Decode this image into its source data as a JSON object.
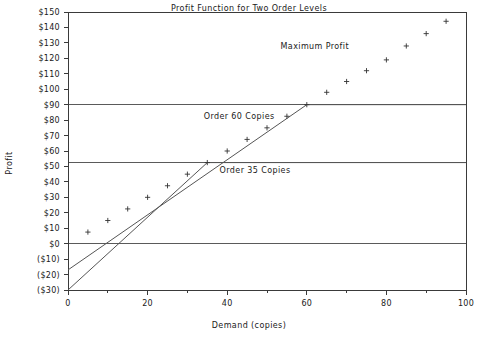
{
  "chart_data": {
    "type": "scatter",
    "title": "Profit Function for Two Order Levels",
    "xlabel": "Demand (copies)",
    "ylabel": "Profit",
    "xlim": [
      0,
      100
    ],
    "ylim": [
      -30,
      150
    ],
    "grid": false,
    "legend": "none",
    "x_ticks": [
      0,
      20,
      40,
      60,
      80,
      100
    ],
    "x_tick_labels": [
      "0",
      "20",
      "40",
      "60",
      "80",
      "100"
    ],
    "x_minor_ticks": [
      10,
      30,
      50,
      70,
      90
    ],
    "y_ticks": [
      -30,
      -20,
      -10,
      0,
      10,
      20,
      30,
      40,
      50,
      60,
      70,
      80,
      90,
      100,
      110,
      120,
      130,
      140,
      150
    ],
    "y_tick_labels": [
      "($30)",
      "($20)",
      "($10)",
      "$0",
      "$10",
      "$20",
      "$30",
      "$40",
      "$50",
      "$60",
      "$70",
      "$80",
      "$90",
      "$100",
      "$110",
      "$120",
      "$130",
      "$140",
      "$150"
    ],
    "reference_lines": [
      {
        "name": "zero-line",
        "y": 0
      },
      {
        "name": "order-35-plateau-level",
        "y": 52.5
      },
      {
        "name": "order-60-plateau-level",
        "y": 90
      }
    ],
    "series": [
      {
        "name": "Order 35 Copies",
        "type": "line",
        "points": [
          [
            0,
            -30
          ],
          [
            35,
            52.5
          ],
          [
            100,
            52.5
          ]
        ],
        "annotation": {
          "label": "Order 35 Copies",
          "x": 47,
          "y": 46
        }
      },
      {
        "name": "Order 60 Copies",
        "type": "line",
        "points": [
          [
            0,
            -17
          ],
          [
            60,
            90
          ],
          [
            100,
            90
          ]
        ],
        "annotation": {
          "label": "Order 60 Copies",
          "x": 43,
          "y": 81
        }
      },
      {
        "name": "Maximum Profit",
        "type": "scatter",
        "marker": "plus",
        "annotation": {
          "label": "Maximum Profit",
          "x": 62,
          "y": 126
        },
        "points": [
          [
            5,
            7.5
          ],
          [
            10,
            15
          ],
          [
            15,
            22.5
          ],
          [
            20,
            30
          ],
          [
            25,
            37.5
          ],
          [
            30,
            45
          ],
          [
            35,
            52.5
          ],
          [
            40,
            60
          ],
          [
            45,
            67.5
          ],
          [
            50,
            75
          ],
          [
            55,
            82.5
          ],
          [
            60,
            90
          ],
          [
            65,
            98
          ],
          [
            70,
            105
          ],
          [
            75,
            112
          ],
          [
            80,
            119
          ],
          [
            85,
            128
          ],
          [
            90,
            136
          ],
          [
            95,
            144
          ]
        ]
      }
    ]
  }
}
